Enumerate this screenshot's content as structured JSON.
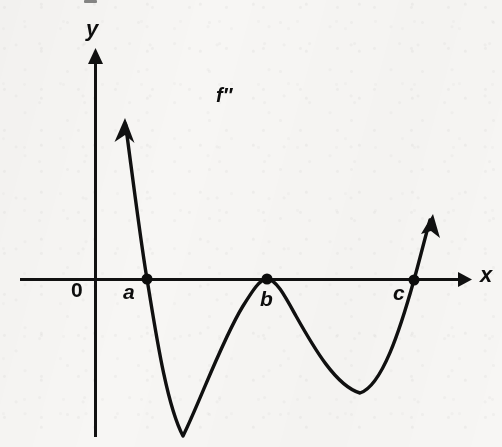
{
  "figure": {
    "title": "",
    "background_color": "#f7f6f4",
    "ink_color": "#111111",
    "width": 502,
    "height": 447
  },
  "axes": {
    "x_label": "x",
    "y_label": "y",
    "origin_label": "0",
    "x_axis": {
      "y_pixel": 279,
      "x_start": 20,
      "x_end": 470,
      "arrow": "right"
    },
    "y_axis": {
      "x_pixel": 95,
      "y_top": 50,
      "y_bottom": 437,
      "arrow": "up"
    }
  },
  "curve": {
    "name": "f''",
    "label": "f″",
    "label_position": {
      "x": 225,
      "y": 96
    },
    "description": "Graph of the second derivative f-double-prime crossing the x-axis at a and c and touching it tangentially at b",
    "left_arrow_tip": {
      "x": 125,
      "y": 122
    },
    "right_arrow_tip": {
      "x": 432,
      "y": 218
    },
    "path": "M 125.5 124 C 133 180, 141 244, 147 279 C 155 327, 166 404, 183 436 C 199 404, 222 340, 243 306 C 253 290, 260 279, 267 279 C 276 279, 285 296, 296 316 C 314 348, 336 386, 360 393 C 382 386, 400 330, 414 280 C 419 262, 425 238, 430 220"
  },
  "points": [
    {
      "id": "a",
      "label": "a",
      "x": 147,
      "y": 279,
      "label_x": 130,
      "label_y": 292,
      "kind": "x-intercept",
      "crossing": "sign-change",
      "radius": 5.5
    },
    {
      "id": "b",
      "label": "b",
      "x": 267,
      "y": 279,
      "label_x": 267,
      "label_y": 300,
      "kind": "x-intercept",
      "crossing": "tangent-touch",
      "radius": 5.5
    },
    {
      "id": "c",
      "label": "c",
      "x": 414,
      "y": 280,
      "label_x": 400,
      "label_y": 293,
      "kind": "x-intercept",
      "crossing": "sign-change",
      "radius": 5.5
    }
  ],
  "chart_data": {
    "type": "line",
    "title": "",
    "xlabel": "x",
    "ylabel": "y",
    "grid": false,
    "legend": null,
    "annotations": [
      "f″",
      "0",
      "a",
      "b",
      "c",
      "x",
      "y"
    ],
    "series": [
      {
        "name": "f''",
        "x": [
          125,
          135,
          147,
          160,
          172,
          183,
          196,
          210,
          225,
          243,
          255,
          267,
          280,
          296,
          315,
          335,
          360,
          382,
          398,
          414,
          424,
          432
        ],
        "y_pixel": [
          124,
          185,
          279,
          345,
          410,
          436,
          418,
          382,
          336,
          306,
          288,
          279,
          285,
          316,
          352,
          381,
          393,
          386,
          342,
          280,
          243,
          218
        ],
        "y_sign": [
          "+",
          "+",
          "0",
          "-",
          "-",
          "-",
          "-",
          "-",
          "-",
          "-",
          "-",
          "0",
          "-",
          "-",
          "-",
          "-",
          "-",
          "-",
          "-",
          "0",
          "+",
          "+"
        ]
      }
    ],
    "zeros": [
      "a",
      "b",
      "c"
    ],
    "local_minima_pixels": [
      {
        "x": 183,
        "y": 436
      },
      {
        "x": 360,
        "y": 393
      }
    ],
    "local_maxima_pixels": [
      {
        "x": 267,
        "y": 279
      }
    ]
  }
}
